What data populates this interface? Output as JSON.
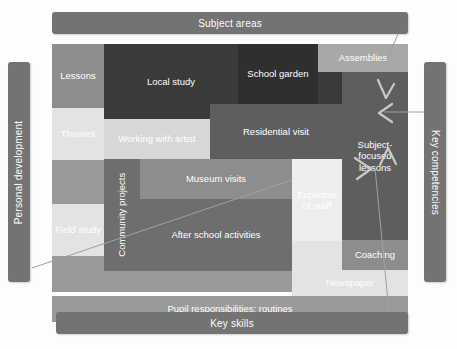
{
  "diagram": {
    "outer_bars": [
      {
        "id": "subject-areas",
        "label": "Subject areas",
        "orientation": "horizontal",
        "position": "top"
      },
      {
        "id": "key-skills",
        "label": "Key skills",
        "orientation": "horizontal",
        "position": "bottom"
      },
      {
        "id": "personal-development",
        "label": "Personal development",
        "orientation": "vertical",
        "position": "left"
      },
      {
        "id": "key-competencies",
        "label": "Key competencies",
        "orientation": "vertical",
        "position": "right"
      }
    ],
    "cells": [
      {
        "id": "lessons",
        "label": "Lessons"
      },
      {
        "id": "local-study",
        "label": "Local study"
      },
      {
        "id": "school-garden",
        "label": "School garden"
      },
      {
        "id": "assemblies",
        "label": "Assemblies"
      },
      {
        "id": "working-with-artist",
        "label": "Working with artist"
      },
      {
        "id": "residential-visit",
        "label": "Residential visit"
      },
      {
        "id": "subject-focused-lessons",
        "label": "Subject-focused lessons"
      },
      {
        "id": "themes",
        "label": "Themes"
      },
      {
        "id": "community-projects",
        "label": "Community projects"
      },
      {
        "id": "museum-visits",
        "label": "Museum visits"
      },
      {
        "id": "expertise-of-staff",
        "label": "Expertise of staff"
      },
      {
        "id": "field-study",
        "label": "Field study"
      },
      {
        "id": "after-school-activities",
        "label": "After school activities"
      },
      {
        "id": "coaching",
        "label": "Coaching"
      },
      {
        "id": "newspaper",
        "label": "Newspaper"
      },
      {
        "id": "pupil-responsibilities",
        "label": "Pupil responsibilities: routines"
      }
    ],
    "colors": {
      "bar": "#737373",
      "bar_text": "#ffffff",
      "darkest": "#2f2f2f",
      "dark": "#3a3a3a",
      "mid": "#5e5e5e",
      "grey": "#8d8d8d",
      "light": "#d7d7d7",
      "lightest": "#ededed",
      "connector": "#9a9a9a"
    },
    "connectors": [
      {
        "from": "subject-areas",
        "to": "subject-focused-lessons"
      },
      {
        "from": "key-competencies",
        "to": "subject-focused-lessons"
      },
      {
        "from": "key-skills",
        "to": "subject-focused-lessons"
      },
      {
        "from": "personal-development",
        "to": "expertise-of-staff"
      }
    ]
  }
}
